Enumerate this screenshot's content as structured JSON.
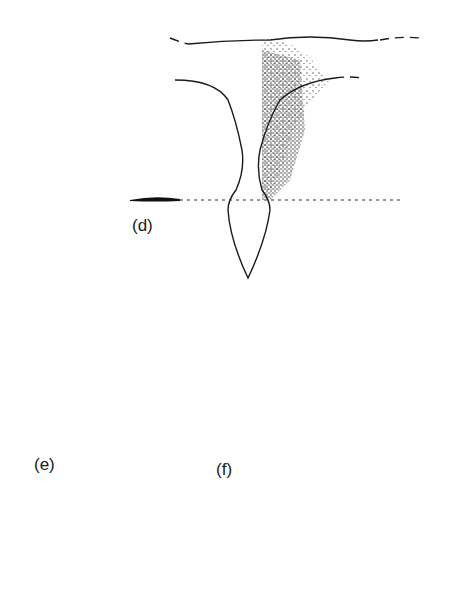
{
  "figure": {
    "panels": [
      {
        "id": "d",
        "label": "(d)",
        "marker_shape": "flat-lens",
        "stipple": "concentrated right side of upper stalk"
      },
      {
        "id": "e",
        "label": "(e)",
        "marker_shape": "small-dome",
        "stipple": "light, spread across stalk"
      },
      {
        "id": "f",
        "label": "(f)",
        "marker_shape": "triangle-peak",
        "stipple": "dense band along right half of full stalk"
      }
    ],
    "colors": {
      "ink": "#1a1a1a",
      "background": "#ffffff"
    }
  }
}
